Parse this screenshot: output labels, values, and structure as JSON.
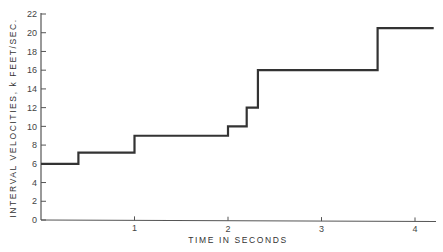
{
  "chart_data": {
    "type": "line",
    "subtype": "step",
    "title": "",
    "xlabel": "TIME IN SECONDS",
    "ylabel": "INTERVAL VELOCITIES, k FEET/SEC.",
    "xlim": [
      0,
      4.2
    ],
    "ylim": [
      0,
      22
    ],
    "x_ticks": [
      1,
      2,
      3,
      4
    ],
    "x_tick_labels": [
      "1",
      "2",
      "3",
      "4"
    ],
    "y_ticks": [
      0,
      2,
      4,
      6,
      8,
      10,
      12,
      14,
      16,
      18,
      20,
      22
    ],
    "y_tick_labels": [
      "0",
      "2",
      "4",
      "6",
      "8",
      "10",
      "12",
      "14",
      "16",
      "18",
      "20",
      "22"
    ],
    "grid": false,
    "legend": null,
    "series": [
      {
        "name": "Interval velocity",
        "color": "#333333",
        "steps": [
          {
            "t_start": 0.0,
            "t_end": 0.4,
            "velocity": 6.0
          },
          {
            "t_start": 0.4,
            "t_end": 1.0,
            "velocity": 7.2
          },
          {
            "t_start": 1.0,
            "t_end": 2.0,
            "velocity": 9.0
          },
          {
            "t_start": 2.0,
            "t_end": 2.2,
            "velocity": 10.0
          },
          {
            "t_start": 2.2,
            "t_end": 2.32,
            "velocity": 12.0
          },
          {
            "t_start": 2.32,
            "t_end": 3.6,
            "velocity": 16.0
          },
          {
            "t_start": 3.6,
            "t_end": 4.2,
            "velocity": 20.5
          }
        ]
      }
    ]
  }
}
